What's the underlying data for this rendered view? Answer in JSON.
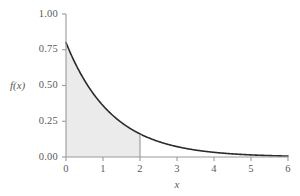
{
  "chart_data": {
    "type": "area",
    "title": "",
    "subtitle": "",
    "xlabel": "x",
    "ylabel": "f(x)",
    "xlim": [
      0,
      6
    ],
    "ylim": [
      0,
      1.0
    ],
    "grid": false,
    "legend": null,
    "curve": {
      "name": "exponential density",
      "formula": "f(x) = 0.8 * exp(-0.8 * x)",
      "scale": 0.8,
      "rate": 0.8,
      "x": [
        0,
        0.25,
        0.5,
        0.75,
        1,
        1.25,
        1.5,
        1.75,
        2,
        2.5,
        3,
        3.5,
        4,
        4.5,
        5,
        5.5,
        6
      ],
      "y": [
        0.8,
        0.655,
        0.536,
        0.439,
        0.359,
        0.294,
        0.241,
        0.197,
        0.162,
        0.108,
        0.073,
        0.049,
        0.033,
        0.022,
        0.015,
        0.01,
        0.007
      ]
    },
    "shaded_region": {
      "label": "shaded area under curve",
      "x_from": 0,
      "x_to": 2,
      "fill_color": "#ebebeb",
      "area_value": 0.798
    },
    "boundary_line": {
      "x": 2,
      "y_from": 0,
      "y_to": 0.162
    },
    "x_ticks": [
      {
        "value": 0,
        "label": "0"
      },
      {
        "value": 1,
        "label": "1"
      },
      {
        "value": 2,
        "label": "2"
      },
      {
        "value": 3,
        "label": "3"
      },
      {
        "value": 4,
        "label": "4"
      },
      {
        "value": 5,
        "label": "5"
      },
      {
        "value": 6,
        "label": "6"
      }
    ],
    "y_ticks": [
      {
        "value": 0.0,
        "label": "0.00"
      },
      {
        "value": 0.25,
        "label": "0.25"
      },
      {
        "value": 0.5,
        "label": "0.50"
      },
      {
        "value": 0.75,
        "label": "0.75"
      },
      {
        "value": 1.0,
        "label": "1.00"
      }
    ],
    "colors": {
      "curve": "#2b2b2b",
      "axis": "#9a9a9a",
      "tick_text": "#5a5a5a",
      "shaded_fill": "#ebebeb",
      "background": "#ffffff"
    }
  }
}
